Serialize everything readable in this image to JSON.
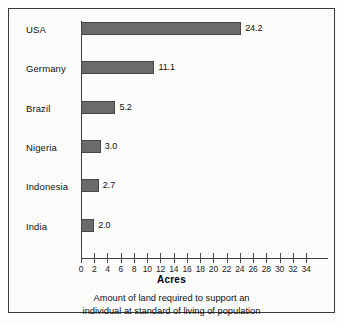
{
  "chart_data": {
    "type": "bar",
    "orientation": "horizontal",
    "title": "",
    "xlabel": "Acres",
    "ylabel": "",
    "categories": [
      "USA",
      "Germany",
      "Brazil",
      "Nigeria",
      "Indonesia",
      "India"
    ],
    "values": [
      24.2,
      11.1,
      5.2,
      3.0,
      2.7,
      2.0
    ],
    "value_labels": [
      "24.2",
      "11.1",
      "5.2",
      "3.0",
      "2.7",
      "2.0"
    ],
    "xlim": [
      0,
      34
    ],
    "xticks": [
      0,
      2,
      4,
      6,
      8,
      10,
      12,
      14,
      16,
      18,
      20,
      22,
      24,
      26,
      28,
      30,
      32,
      34
    ],
    "xtick_labels": [
      "0",
      "2",
      "4",
      "6",
      "8",
      "10",
      "12",
      "14",
      "16",
      "18",
      "20",
      "22",
      "24",
      "26",
      "28",
      "30",
      "32",
      "34"
    ],
    "grid": false,
    "legend": null,
    "bar_color": "#6b6b6b",
    "bar_edge_color": "#474747",
    "axis_color": "#3f3f3f",
    "background_color": "#fcfcfc",
    "caption_lines": [
      "Amount of land required to support an",
      "individual at standard of living of population"
    ]
  }
}
